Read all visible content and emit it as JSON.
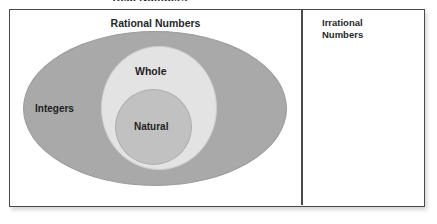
{
  "diagram": {
    "title": "Real Numbers",
    "type": "venn-nested-sets",
    "panels": {
      "rational": {
        "label": "Rational Numbers"
      },
      "irrational": {
        "label_line1": "Irrational",
        "label_line2": "Numbers"
      }
    },
    "sets": [
      {
        "name": "integers",
        "label": "Integers",
        "fill": "#a9a9a9",
        "level": 1
      },
      {
        "name": "whole",
        "label": "Whole",
        "fill": "#e3e3e3",
        "level": 2
      },
      {
        "name": "natural",
        "label": "Natural",
        "fill": "#c1c1c1",
        "level": 3
      }
    ],
    "colors": {
      "border": "#4a4a4a",
      "background": "#ffffff",
      "text": "#1f1f1f"
    }
  }
}
